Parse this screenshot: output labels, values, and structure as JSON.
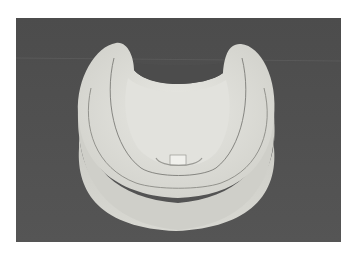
{
  "figure": {
    "background_color": "#4a4a4a",
    "cast_color": "#dcdcd6",
    "page_background": "#ffffff"
  }
}
